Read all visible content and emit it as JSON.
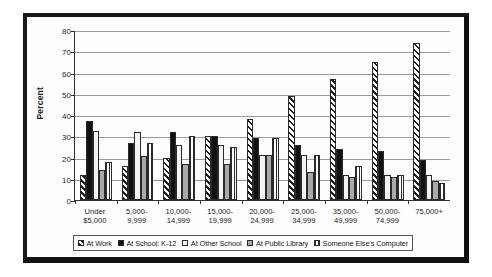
{
  "chart_data": {
    "type": "bar",
    "title": "",
    "subtitle": "",
    "xlabel": "",
    "ylabel": "Percent",
    "ylim": [
      0,
      80
    ],
    "ytick_step": 10,
    "yticks": [
      "0",
      "10",
      "20",
      "30",
      "40",
      "50",
      "60",
      "70",
      "80"
    ],
    "grid": true,
    "legend_position": "bottom",
    "categories": [
      "Under\n$5,000",
      "5,000-\n9,999",
      "10,000-\n14,999",
      "15,000-\n19,999",
      "20,000-\n24,999",
      "25,000-\n34,999",
      "35,000-\n49,999",
      "50,000-\n74,999",
      "75,000+"
    ],
    "series": [
      {
        "name": "At Work",
        "pattern": "diagonal-hatch",
        "values": [
          12,
          16,
          20,
          30,
          38,
          49,
          57,
          65,
          74
        ]
      },
      {
        "name": "At School: K-12",
        "pattern": "solid-black",
        "values": [
          37,
          27,
          32,
          30,
          29,
          26,
          24,
          23,
          19
        ]
      },
      {
        "name": "At Other School",
        "pattern": "white",
        "values": [
          32.5,
          32,
          26,
          26,
          21,
          21,
          12,
          12,
          12
        ]
      },
      {
        "name": "At Public Library",
        "pattern": "gray",
        "values": [
          14,
          20.5,
          17,
          17,
          21,
          13,
          11,
          11,
          9
        ]
      },
      {
        "name": "Someone Else's Computer",
        "pattern": "vertical-stripes",
        "values": [
          18,
          27,
          30,
          25,
          29,
          21,
          16,
          12,
          8
        ]
      }
    ]
  },
  "axis": {
    "y_title": "Percent"
  },
  "legend": {
    "items": [
      {
        "label": "At Work"
      },
      {
        "label": "At School: K-12"
      },
      {
        "label": "At Other School"
      },
      {
        "label": "At Public Library"
      },
      {
        "label": "Someone Else's Computer"
      }
    ]
  },
  "colors": {
    "frame": "#111111",
    "grid": "#9a9a9a",
    "axis": "#303030",
    "text": "#1d1d1d",
    "series_black": "#111111",
    "series_white": "#f4f4f4",
    "series_gray": "#a9a9a9"
  }
}
